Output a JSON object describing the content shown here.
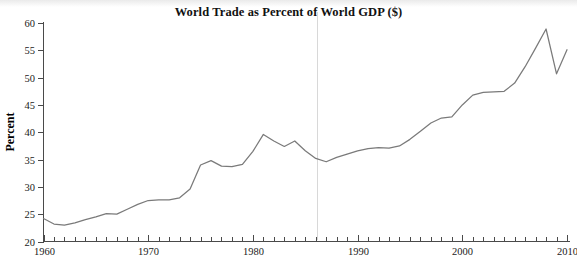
{
  "chart_data": {
    "type": "line",
    "title": "World Trade as Percent of World GDP ($)",
    "xlabel": "",
    "ylabel": "Percent",
    "xlim": [
      1960,
      2010
    ],
    "ylim": [
      20,
      60
    ],
    "grid": false,
    "legend": null,
    "y_ticks": [
      20,
      25,
      30,
      35,
      40,
      45,
      50,
      55,
      60
    ],
    "y_tick_labels": [
      "20",
      "25",
      "30",
      "35",
      "40",
      "45",
      "50",
      "55",
      "60"
    ],
    "x_ticks": [
      1960,
      1970,
      1980,
      1990,
      2000,
      2010
    ],
    "x_tick_labels": [
      "1960",
      "1970",
      "1980",
      "1990",
      "2000",
      "2010"
    ],
    "x_minor_tick_interval": 1,
    "line_color": "#7a7a7a",
    "axis_color": "#4a4a4a",
    "x": [
      1960,
      1961,
      1962,
      1963,
      1964,
      1965,
      1966,
      1967,
      1968,
      1969,
      1970,
      1971,
      1972,
      1973,
      1974,
      1975,
      1976,
      1977,
      1978,
      1979,
      1980,
      1981,
      1982,
      1983,
      1984,
      1985,
      1986,
      1987,
      1988,
      1989,
      1990,
      1991,
      1992,
      1993,
      1994,
      1995,
      1996,
      1997,
      1998,
      1999,
      2000,
      2001,
      2002,
      2003,
      2004,
      2005,
      2006,
      2007,
      2008,
      2009,
      2010
    ],
    "values": [
      24.2,
      23.2,
      23.0,
      23.4,
      24.0,
      24.5,
      25.1,
      25.0,
      25.9,
      26.8,
      27.5,
      27.6,
      27.6,
      28.0,
      29.6,
      34.0,
      34.8,
      33.8,
      33.7,
      34.1,
      36.5,
      39.6,
      38.4,
      37.4,
      38.4,
      36.6,
      35.2,
      34.6,
      35.4,
      36.0,
      36.6,
      37.0,
      37.2,
      37.1,
      37.5,
      38.7,
      40.2,
      41.7,
      42.6,
      42.8,
      45.0,
      46.8,
      47.3,
      47.4,
      47.5,
      49.0,
      52.0,
      55.4,
      58.9,
      50.7,
      55.1
    ],
    "units": "percent"
  },
  "figure": {
    "title_text": "World Trade as Percent of World GDP ($)",
    "y_axis_label": "Percent"
  }
}
